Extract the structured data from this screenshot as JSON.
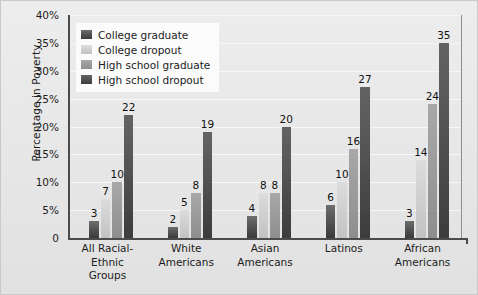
{
  "chart_data": {
    "type": "bar",
    "title": "",
    "xlabel": "",
    "ylabel": "Percentage in Poverty",
    "ylim": [
      0,
      40
    ],
    "ytick_labels": [
      "0",
      "5%",
      "10%",
      "15%",
      "20%",
      "25%",
      "30%",
      "35%",
      "40%"
    ],
    "ytick_values": [
      0,
      5,
      10,
      15,
      20,
      25,
      30,
      35,
      40
    ],
    "grid": true,
    "legend_position": "upper-left-inside",
    "categories": [
      "All Racial-Ethnic Groups",
      "White Americans",
      "Asian Americans",
      "Latinos",
      "African Americans"
    ],
    "category_lines": [
      [
        "All Racial-Ethnic",
        "Groups"
      ],
      [
        "White",
        "Americans"
      ],
      [
        "Asian",
        "Americans"
      ],
      [
        "Latinos",
        ""
      ],
      [
        "African",
        "Americans"
      ]
    ],
    "series": [
      {
        "name": "College graduate",
        "color": "#4a4a4a",
        "values": [
          3,
          2,
          4,
          6,
          3
        ],
        "labels": [
          "3",
          "2",
          "4",
          "6",
          "3"
        ]
      },
      {
        "name": "College dropout",
        "color": "#d2d2d2",
        "values": [
          7,
          5,
          8,
          10,
          14
        ],
        "labels": [
          "7",
          "5",
          "8",
          "10",
          "14"
        ]
      },
      {
        "name": "High school graduate",
        "color": "#9a9a9a",
        "values": [
          10,
          8,
          8,
          16,
          24
        ],
        "labels": [
          "10",
          "8",
          "8",
          "16",
          "24"
        ]
      },
      {
        "name": "High school dropout",
        "color": "#4f4f4f",
        "values": [
          22,
          19,
          20,
          27,
          35
        ],
        "labels": [
          "22",
          "19",
          "20",
          "27",
          "35"
        ]
      }
    ]
  },
  "figure": {
    "background_color": "#e9e9e9",
    "axis_color": "#4b4b4b",
    "gridline_color": "#f7f7f7",
    "legend_background": "#fbfbfb"
  }
}
